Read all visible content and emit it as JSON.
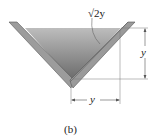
{
  "figure": {
    "caption": "(b)",
    "labels": {
      "slant_length": "√2y",
      "depth": "y",
      "half_width": "y"
    },
    "colors": {
      "water_top": "#b9b9b9",
      "water_bottom": "#6e6e6e",
      "wall_face": "#9a9a9a",
      "wall_edge": "#5a5a5a",
      "dimension_line": "#555555"
    }
  }
}
